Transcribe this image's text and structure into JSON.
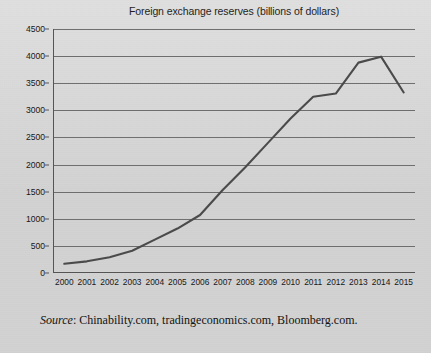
{
  "chart_data": {
    "type": "line",
    "title": "Foreign exchange reserves (billions of dollars)",
    "xlabel": "",
    "ylabel": "",
    "categories": [
      "2000",
      "2001",
      "2002",
      "2003",
      "2004",
      "2005",
      "2006",
      "2007",
      "2008",
      "2009",
      "2010",
      "2011",
      "2012",
      "2013",
      "2014",
      "2015"
    ],
    "values": [
      170,
      215,
      290,
      410,
      615,
      820,
      1070,
      1530,
      1950,
      2400,
      2850,
      3250,
      3310,
      3880,
      3990,
      3330
    ],
    "series": [
      {
        "name": "Foreign exchange reserves",
        "values": [
          170,
          215,
          290,
          410,
          615,
          820,
          1070,
          1530,
          1950,
          2400,
          2850,
          3250,
          3310,
          3880,
          3990,
          3330
        ]
      }
    ],
    "ylim": [
      0,
      4500
    ],
    "ytick_labels": [
      "0",
      "500",
      "1000",
      "1500",
      "2000",
      "2500",
      "3000",
      "3500",
      "4000",
      "4500"
    ],
    "ytick_values": [
      0,
      500,
      1000,
      1500,
      2000,
      2500,
      3000,
      3500,
      4000,
      4500
    ],
    "grid": true,
    "legend": false,
    "line_color": "#4a4a4a",
    "grid_color": "#6e6e6e",
    "background_color": "#d2d2d2"
  },
  "source": {
    "label": "Source",
    "separator": ": ",
    "text": "Chinability.com, tradingeconomics.com, Bloomberg.com."
  }
}
